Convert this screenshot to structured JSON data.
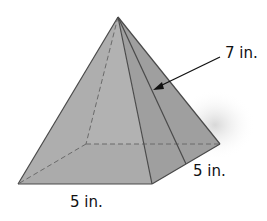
{
  "figure": {
    "type": "square-pyramid",
    "labels": {
      "slant_height": "7 in.",
      "base_side_right": "5 in.",
      "base_side_front": "5 in."
    },
    "colors": {
      "face_light": "#c9c9c9",
      "face_mid": "#a9a9a9",
      "face_dark": "#9e9e9e",
      "base": "#a2a2a2",
      "edge": "#4a4a4a",
      "hidden_edge": "#6a6a6a"
    }
  }
}
